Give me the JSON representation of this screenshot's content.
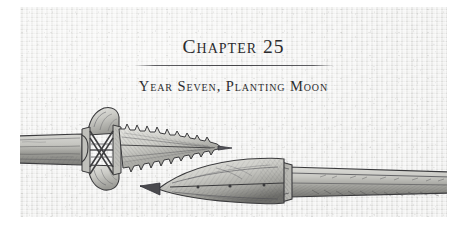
{
  "page": {
    "background_color": "#ffffff",
    "panel_background_color": "#e9e9e7"
  },
  "heading": {
    "chapter_title": "Chapter 25",
    "subtitle": "Year Seven, Planting Moon",
    "rule_color": "#46464a",
    "text_color": "#2b2b2d"
  },
  "illustration": {
    "name": "harpoon-and-spearhead-illustration",
    "description": "Pen-and-ink drawing of two ancient weapon points",
    "ink_color": "#3a3a3c",
    "items": [
      {
        "name": "barbed-harpoon-point",
        "label": "Barbed harpoon head lashed to a wooden shaft"
      },
      {
        "name": "leaf-spearhead",
        "label": "Leaf-shaped socketed spearhead on a long shaft"
      }
    ]
  }
}
